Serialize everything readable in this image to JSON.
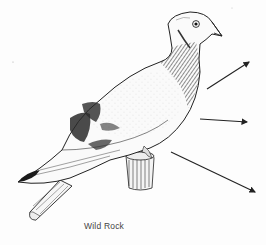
{
  "figure": {
    "caption": "Wild Rock",
    "style": "pen-and-ink line drawing",
    "colors": {
      "ink": "#1e1e1e",
      "background": "#fdfdfd",
      "caption": "#444444"
    },
    "arrows": [
      {
        "name": "arrow-upper-right",
        "from": [
          207,
          89
        ],
        "to": [
          250,
          62
        ]
      },
      {
        "name": "arrow-middle-right",
        "from": [
          200,
          119
        ],
        "to": [
          248,
          122
        ]
      },
      {
        "name": "arrow-lower-right",
        "from": [
          171,
          152
        ],
        "to": [
          256,
          193
        ]
      }
    ]
  }
}
